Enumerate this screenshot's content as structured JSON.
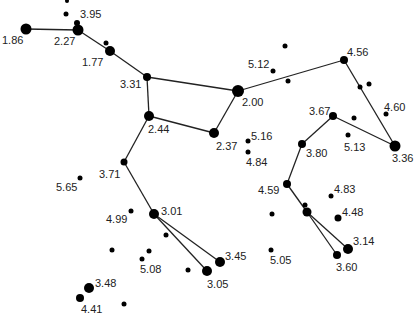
{
  "diagram": {
    "type": "star-chart",
    "background": "#ffffff",
    "line_color": "#222222",
    "star_color": "#000000",
    "stars": [
      {
        "id": "s186",
        "x": 26,
        "y": 29,
        "r": 5.5,
        "label": "1.86",
        "lx": 2,
        "ly": 44
      },
      {
        "id": "s227",
        "x": 78,
        "y": 30,
        "r": 5.5,
        "label": "2.27",
        "lx": 54,
        "ly": 45
      },
      {
        "id": "s395",
        "x": 77,
        "y": 23,
        "r": 3,
        "label": "3.95",
        "lx": 80,
        "ly": 18
      },
      {
        "id": "sa1",
        "x": 66,
        "y": 14,
        "r": 2.5,
        "label": "",
        "lx": 0,
        "ly": 0
      },
      {
        "id": "sa2",
        "x": 67,
        "y": 1,
        "r": 2,
        "label": "",
        "lx": 0,
        "ly": 0
      },
      {
        "id": "s177",
        "x": 110,
        "y": 51,
        "r": 5,
        "label": "1.77",
        "lx": 82,
        "ly": 66
      },
      {
        "id": "sa3",
        "x": 106,
        "y": 43,
        "r": 2.5,
        "label": "",
        "lx": 0,
        "ly": 0
      },
      {
        "id": "s331",
        "x": 147,
        "y": 77,
        "r": 4,
        "label": "3.31",
        "lx": 120,
        "ly": 88
      },
      {
        "id": "s200",
        "x": 238,
        "y": 91,
        "r": 6,
        "label": "2.00",
        "lx": 242,
        "ly": 106
      },
      {
        "id": "s244",
        "x": 149,
        "y": 116,
        "r": 5,
        "label": "2.44",
        "lx": 148,
        "ly": 133
      },
      {
        "id": "s237",
        "x": 214,
        "y": 133,
        "r": 5,
        "label": "2.37",
        "lx": 216,
        "ly": 150
      },
      {
        "id": "s512",
        "x": 273,
        "y": 71,
        "r": 2.5,
        "label": "5.12",
        "lx": 248,
        "ly": 68
      },
      {
        "id": "sa4",
        "x": 285,
        "y": 46,
        "r": 2.5,
        "label": "",
        "lx": 0,
        "ly": 0
      },
      {
        "id": "sa5",
        "x": 288,
        "y": 81,
        "r": 2.5,
        "label": "",
        "lx": 0,
        "ly": 0
      },
      {
        "id": "s516",
        "x": 248,
        "y": 141,
        "r": 2.5,
        "label": "5.16",
        "lx": 251,
        "ly": 140
      },
      {
        "id": "s484",
        "x": 248,
        "y": 152,
        "r": 2.5,
        "label": "4.84",
        "lx": 246,
        "ly": 166
      },
      {
        "id": "s456",
        "x": 344,
        "y": 60,
        "r": 4,
        "label": "4.56",
        "lx": 347,
        "ly": 56
      },
      {
        "id": "sa6",
        "x": 360,
        "y": 87,
        "r": 2.5,
        "label": "",
        "lx": 0,
        "ly": 0
      },
      {
        "id": "sa7",
        "x": 369,
        "y": 84,
        "r": 2.5,
        "label": "",
        "lx": 0,
        "ly": 0
      },
      {
        "id": "s460",
        "x": 386,
        "y": 114,
        "r": 2.5,
        "label": "4.60",
        "lx": 384,
        "ly": 111
      },
      {
        "id": "s367",
        "x": 333,
        "y": 116,
        "r": 4,
        "label": "3.67",
        "lx": 309,
        "ly": 115
      },
      {
        "id": "sa8",
        "x": 354,
        "y": 118,
        "r": 2.5,
        "label": "",
        "lx": 0,
        "ly": 0
      },
      {
        "id": "s513",
        "x": 348,
        "y": 135,
        "r": 2.5,
        "label": "5.13",
        "lx": 344,
        "ly": 151
      },
      {
        "id": "s336",
        "x": 395,
        "y": 146,
        "r": 5.5,
        "label": "3.36",
        "lx": 392,
        "ly": 162
      },
      {
        "id": "s380",
        "x": 302,
        "y": 144,
        "r": 4,
        "label": "3.80",
        "lx": 306,
        "ly": 157
      },
      {
        "id": "s459",
        "x": 287,
        "y": 184,
        "r": 4,
        "label": "4.59",
        "lx": 258,
        "ly": 194
      },
      {
        "id": "s483",
        "x": 331,
        "y": 196,
        "r": 2.5,
        "label": "4.83",
        "lx": 334,
        "ly": 193
      },
      {
        "id": "sa9",
        "x": 272,
        "y": 214,
        "r": 2.5,
        "label": "",
        "lx": 0,
        "ly": 0
      },
      {
        "id": "sa10",
        "x": 305,
        "y": 205,
        "r": 2.5,
        "label": "",
        "lx": 0,
        "ly": 0
      },
      {
        "id": "sa11",
        "x": 307,
        "y": 212,
        "r": 4.5,
        "label": "",
        "lx": 0,
        "ly": 0
      },
      {
        "id": "s448",
        "x": 338,
        "y": 218,
        "r": 3.5,
        "label": "4.48",
        "lx": 342,
        "ly": 216
      },
      {
        "id": "s314",
        "x": 348,
        "y": 249,
        "r": 5,
        "label": "3.14",
        "lx": 353,
        "ly": 245
      },
      {
        "id": "s360",
        "x": 337,
        "y": 255,
        "r": 4,
        "label": "3.60",
        "lx": 336,
        "ly": 271
      },
      {
        "id": "s505",
        "x": 271,
        "y": 250,
        "r": 2.5,
        "label": "5.05",
        "lx": 270,
        "ly": 264
      },
      {
        "id": "s565",
        "x": 80,
        "y": 178,
        "r": 2.5,
        "label": "5.65",
        "lx": 56,
        "ly": 191
      },
      {
        "id": "s371",
        "x": 124,
        "y": 162,
        "r": 3.5,
        "label": "3.71",
        "lx": 99,
        "ly": 178
      },
      {
        "id": "s499",
        "x": 131,
        "y": 211,
        "r": 2.5,
        "label": "4.99",
        "lx": 106,
        "ly": 223
      },
      {
        "id": "s301",
        "x": 154,
        "y": 214,
        "r": 5,
        "label": "3.01",
        "lx": 161,
        "ly": 215
      },
      {
        "id": "sa12",
        "x": 166,
        "y": 235,
        "r": 2.5,
        "label": "",
        "lx": 0,
        "ly": 0
      },
      {
        "id": "sa13",
        "x": 112,
        "y": 250,
        "r": 2.5,
        "label": "",
        "lx": 0,
        "ly": 0
      },
      {
        "id": "sa14",
        "x": 149,
        "y": 251,
        "r": 2.5,
        "label": "",
        "lx": 0,
        "ly": 0
      },
      {
        "id": "s508",
        "x": 142,
        "y": 259,
        "r": 2.5,
        "label": "5.08",
        "lx": 140,
        "ly": 273
      },
      {
        "id": "sa15",
        "x": 188,
        "y": 270,
        "r": 2.5,
        "label": "",
        "lx": 0,
        "ly": 0
      },
      {
        "id": "s305",
        "x": 207,
        "y": 271,
        "r": 5,
        "label": "3.05",
        "lx": 207,
        "ly": 288
      },
      {
        "id": "s345",
        "x": 220,
        "y": 262,
        "r": 5,
        "label": "3.45",
        "lx": 225,
        "ly": 260
      },
      {
        "id": "s348",
        "x": 89,
        "y": 288,
        "r": 5,
        "label": "3.48",
        "lx": 95,
        "ly": 287
      },
      {
        "id": "s441",
        "x": 80,
        "y": 298,
        "r": 4,
        "label": "4.41",
        "lx": 81,
        "ly": 313
      },
      {
        "id": "sa16",
        "x": 124,
        "y": 304,
        "r": 2.5,
        "label": "",
        "lx": 0,
        "ly": 0
      }
    ],
    "lines": [
      [
        "s186",
        "s227"
      ],
      [
        "s227",
        "s177"
      ],
      [
        "s177",
        "s331"
      ],
      [
        "s331",
        "s200"
      ],
      [
        "s331",
        "s244"
      ],
      [
        "s244",
        "s237"
      ],
      [
        "s237",
        "s200"
      ],
      [
        "s200",
        "s456"
      ],
      [
        "s456",
        "s336"
      ],
      [
        "s336",
        "s367"
      ],
      [
        "s367",
        "s380"
      ],
      [
        "s380",
        "s459"
      ],
      [
        "s459",
        "sa11"
      ],
      [
        "sa11",
        "s314"
      ],
      [
        "sa11",
        "s360"
      ],
      [
        "s244",
        "s371"
      ],
      [
        "s371",
        "s301"
      ],
      [
        "s301",
        "s345"
      ],
      [
        "s301",
        "s305"
      ]
    ]
  }
}
